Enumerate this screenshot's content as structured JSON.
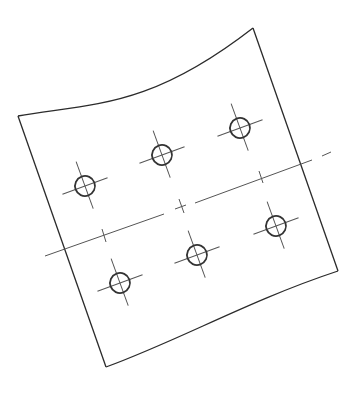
{
  "drawing": {
    "type": "technical-drawing",
    "subject": "plate with six holes",
    "colors": {
      "background": "#ffffff",
      "outline": "#2b2b2b",
      "centerline": "#555555",
      "hole": "#333333"
    },
    "plate": {
      "top_left": [
        18,
        116
      ],
      "top_right": [
        253,
        28
      ],
      "bottom_right": [
        338,
        271
      ],
      "bottom_left": [
        106,
        367
      ]
    },
    "holes": [
      {
        "id": "hole-1",
        "cx": 85,
        "cy": 186,
        "r": 10
      },
      {
        "id": "hole-2",
        "cx": 162,
        "cy": 155,
        "r": 10
      },
      {
        "id": "hole-3",
        "cx": 240,
        "cy": 128,
        "r": 10
      },
      {
        "id": "hole-4",
        "cx": 120,
        "cy": 283,
        "r": 10
      },
      {
        "id": "hole-5",
        "cx": 197,
        "cy": 255,
        "r": 10
      },
      {
        "id": "hole-6",
        "cx": 276,
        "cy": 226,
        "r": 10
      }
    ],
    "hole_count": 6
  }
}
